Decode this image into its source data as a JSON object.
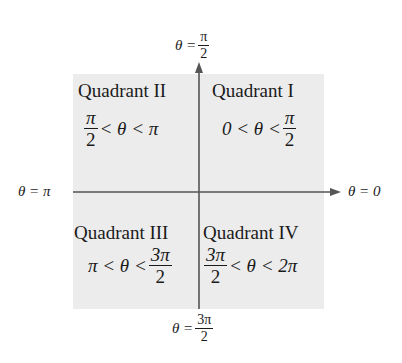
{
  "axes": {
    "top": {
      "lhs": "θ =",
      "num": "π",
      "den": "2"
    },
    "bottom": {
      "lhs": "θ =",
      "num": "3π",
      "den": "2"
    },
    "left": {
      "text": "θ = π"
    },
    "right": {
      "text": "θ = 0"
    }
  },
  "quadrants": [
    {
      "name": "Quadrant I",
      "range_pre": "0 < θ <",
      "range_num": "π",
      "range_den": "2"
    },
    {
      "name": "Quadrant II",
      "range_num": "π",
      "range_den": "2",
      "range_post": "< θ < π"
    },
    {
      "name": "Quadrant III",
      "range_pre": "π < θ <",
      "range_num": "3π",
      "range_den": "2"
    },
    {
      "name": "Quadrant IV",
      "range_num": "3π",
      "range_den": "2",
      "range_post": "< θ < 2π"
    }
  ],
  "colors": {
    "shade": "#ececec",
    "axis": "#555555"
  }
}
